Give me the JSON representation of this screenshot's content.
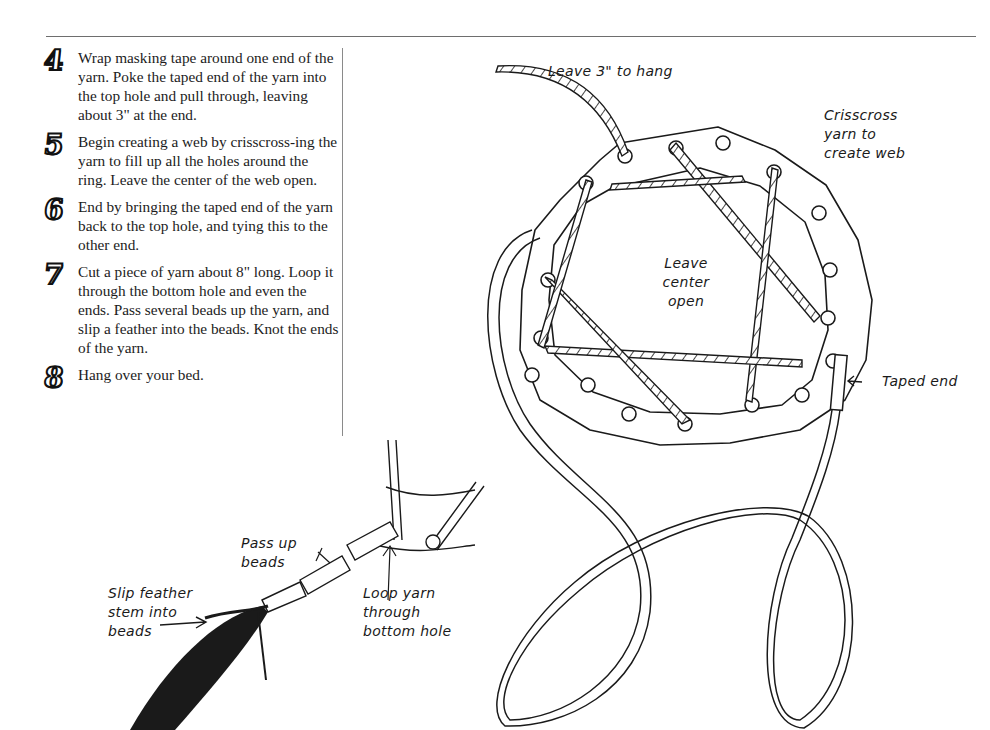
{
  "steps": [
    {
      "number": "4",
      "text": "Wrap masking tape around one end of the yarn. Poke the taped end of the yarn into the top hole and pull through, leaving about 3\" at the end."
    },
    {
      "number": "5",
      "text": "Begin creating a web by crisscross-ing the yarn to fill up all the holes around the ring. Leave the center of the web open."
    },
    {
      "number": "6",
      "text": "End by bringing the taped end of the yarn back to the top hole, and tying this to the other end."
    },
    {
      "number": "7",
      "text": "Cut a piece of yarn about 8\" long. Loop it through the bottom hole and even the ends. Pass several beads up the yarn, and slip a feather into the beads. Knot the ends of the yarn."
    },
    {
      "number": "8",
      "text": "Hang over your bed."
    }
  ],
  "illustration_labels": {
    "leave_hang": "Leave 3\" to hang",
    "crisscross": [
      "Crisscross",
      "yarn to",
      "create web"
    ],
    "center_open": [
      "Leave",
      "center",
      "open"
    ],
    "taped_end": "Taped end",
    "pass_beads": [
      "Pass up",
      "beads"
    ],
    "slip_feather": [
      "Slip feather",
      "stem into",
      "beads"
    ],
    "loop_yarn": [
      "Loop yarn",
      "through",
      "bottom hole"
    ]
  },
  "colors": {
    "ink": "#1a1a1a",
    "rule": "#6e6e6e",
    "paper": "#ffffff"
  }
}
